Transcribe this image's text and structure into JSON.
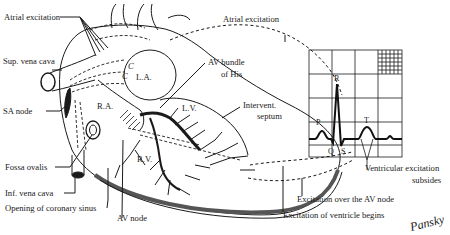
{
  "diagram": {
    "type": "anatomical-diagram",
    "labels_left": {
      "atrial_excitation": "Atrial excitation",
      "sup_vena_cava": "Sup. vena cava",
      "sa_node": "SA node",
      "fossa_ovalis": "Fossa ovalis",
      "inf_vena_cava": "Inf. vena cava",
      "opening_coronary_sinus": "Opening of coronary sinus",
      "av_node": "AV node"
    },
    "labels_heart": {
      "la": "L.A.",
      "ra": "R.A.",
      "lv": "L.V.",
      "rv": "R.V.",
      "c1": "C",
      "c2": "C"
    },
    "labels_right": {
      "atrial_excitation": "Atrial excitation",
      "av_bundle_line1": "AV bundle",
      "av_bundle_line2": "of His",
      "intervent_line1": "Intervent.",
      "intervent_line2": "septum",
      "ventricular_subsides_line1": "Ventricular excitation",
      "ventricular_subsides_line2": "subsides",
      "excitation_av_node": "Excitation over the AV node",
      "excitation_ventricle_begins": "Excitation of ventricle begins"
    },
    "ecg": {
      "waves": {
        "p": "P",
        "q": "Q",
        "r": "R",
        "s": "S",
        "t": "T"
      }
    },
    "signature": "Pansky",
    "colors": {
      "ink": "#1a1a1a",
      "background": "#ffffff"
    }
  }
}
